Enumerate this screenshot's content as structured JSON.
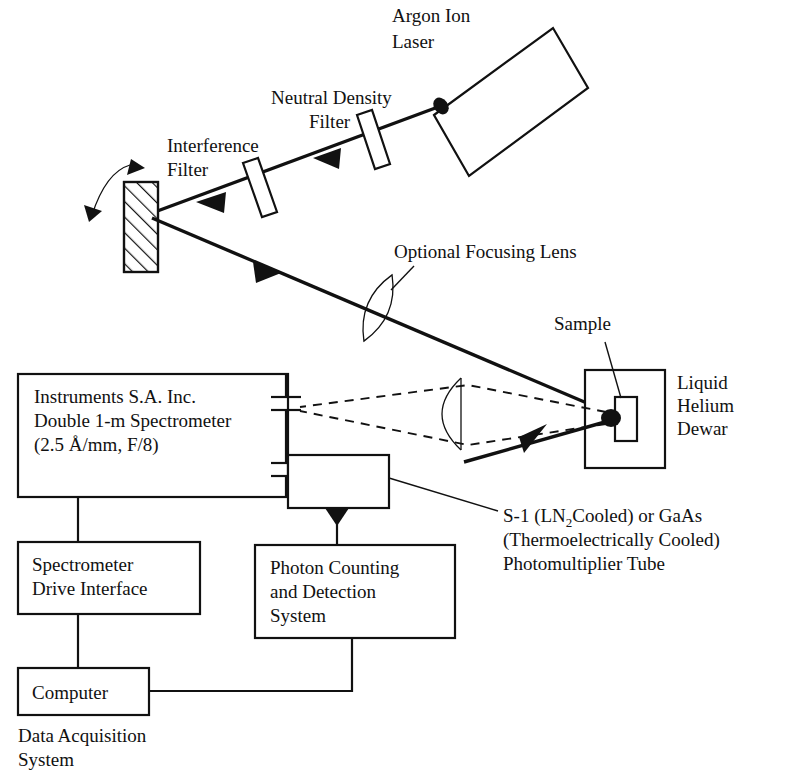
{
  "diagram": {
    "labels": {
      "laser": "Argon Ion\nLaser",
      "laser_line1": "Argon Ion",
      "laser_line2": "Laser",
      "neutral_density_line1": "Neutral Density",
      "neutral_density_line2": "Filter",
      "interference_line1": "Interference",
      "interference_line2": "Filter",
      "optional_lens": "Optional Focusing Lens",
      "sample": "Sample",
      "dewar_line1": "Liquid",
      "dewar_line2": "Helium",
      "dewar_line3": "Dewar",
      "spectrometer_line1": "Instruments S.A. Inc.",
      "spectrometer_line2": "Double 1-m Spectrometer",
      "spectrometer_line3": "(2.5 Å/mm, F/8)",
      "pmt_line1_a": "S-1 (LN",
      "pmt_line1_sub": "2",
      "pmt_line1_b": "Cooled) or GaAs",
      "pmt_line2": "(Thermoelectrically Cooled)",
      "pmt_line3": "Photomultiplier Tube",
      "drive_interface_line1": "Spectrometer",
      "drive_interface_line2": "Drive Interface",
      "photon_counting_line1": "Photon Counting",
      "photon_counting_line2": "and Detection",
      "photon_counting_line3": "System",
      "computer": "Computer",
      "data_acquisition_line1": "Data Acquisition",
      "data_acquisition_line2": "System"
    },
    "colors": {
      "ink": "#111111",
      "background": "#ffffff"
    }
  }
}
